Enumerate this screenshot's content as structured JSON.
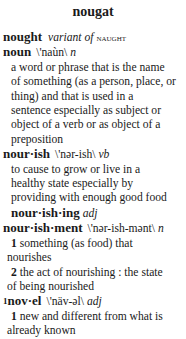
{
  "page": {
    "title": "nougat"
  },
  "entries": {
    "nought": {
      "headword": "nought",
      "variant_label": "variant of",
      "variant_target": "naught"
    },
    "noun": {
      "headword": "noun",
      "pronunciation": "\\'naùn\\",
      "pos": "n",
      "definition_lines": [
        "a word or phrase that is the name",
        "of something (as a person, place, or",
        "thing) and that is used in a",
        "sentence especially as subject or",
        "object of a verb or as object of a",
        "preposition"
      ]
    },
    "nourish": {
      "headword": "nour·ish",
      "pronunciation": "\\'nər-ish\\",
      "pos": "vb",
      "definition_lines": [
        "to cause to grow or live in a",
        "healthy state especially by",
        "providing with enough good food"
      ],
      "derived": {
        "headword": "nour·ish·ing",
        "pos": "adj"
      }
    },
    "nourishment": {
      "headword": "nour·ish·ment",
      "pronunciation": "\\'nər-ish-mənt\\",
      "pos": "n",
      "senses": [
        {
          "number": "1",
          "first_line": "something (as food) that",
          "rest": "nourishes"
        },
        {
          "number": "2",
          "first_line": "the act of nourishing : the state",
          "rest": "of being nourished"
        }
      ]
    },
    "novel": {
      "homograph": "1",
      "headword": "nov·el",
      "pronunciation": "\\'näv-əl\\",
      "pos": "adj",
      "senses": [
        {
          "number": "1",
          "first_line": "new and different from what is",
          "rest": "already known"
        }
      ]
    }
  }
}
